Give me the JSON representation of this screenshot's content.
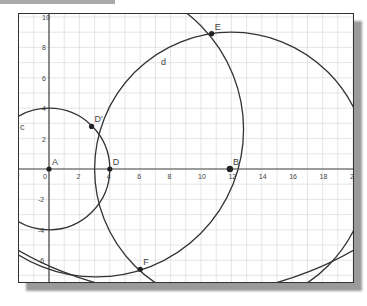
{
  "view": {
    "origin_px": [
      48,
      168
    ],
    "unit_px": 15.2,
    "x_range": [
      -2,
      20
    ],
    "y_range": [
      -7.5,
      10
    ]
  },
  "axes": {
    "x_ticks": [
      "2",
      "0",
      "2",
      "4",
      "6",
      "8",
      "10",
      "12",
      "14",
      "16",
      "18",
      "20"
    ],
    "x_tick_values": [
      -2,
      0,
      2,
      4,
      6,
      8,
      10,
      12,
      14,
      16,
      18,
      20
    ],
    "y_ticks": [
      "10",
      "8",
      "6",
      "4",
      "2",
      "-2",
      "-4",
      "-6"
    ],
    "y_tick_values": [
      10,
      8,
      6,
      4,
      2,
      -2,
      -4,
      -6
    ]
  },
  "points": [
    {
      "label": "A",
      "x": 0,
      "y": 0
    },
    {
      "label": "D",
      "x": 4,
      "y": 0
    },
    {
      "label": "D'",
      "x": 2.8,
      "y": 2.8
    },
    {
      "label": "B",
      "x": 11.9,
      "y": 0
    },
    {
      "label": "E",
      "x": 10.7,
      "y": 8.9
    },
    {
      "label": "F",
      "x": 6.0,
      "y": -6.6
    }
  ],
  "curves": [
    {
      "label": "c",
      "type": "circle",
      "cx": 0,
      "cy": 0,
      "r": 4
    },
    {
      "label": "d",
      "type": "circle",
      "cx": 12,
      "cy": 0,
      "r": 9
    },
    {
      "label": "",
      "type": "circle",
      "cx": 3.1,
      "cy": 2.6,
      "r": 9.7
    },
    {
      "label": "",
      "type": "circle",
      "cx": 9.0,
      "cy": 13.7,
      "r": 22.0
    }
  ],
  "labels": {
    "c": "c",
    "d": "d"
  },
  "colors": {
    "curve": "#333333",
    "axis": "#444444",
    "grid": "#dedede",
    "point": "#222222",
    "text": "#444444"
  }
}
